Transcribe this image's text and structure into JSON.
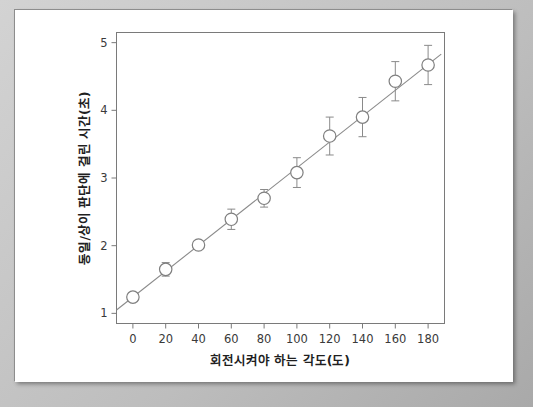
{
  "chart_data": {
    "type": "scatter",
    "title": "",
    "xlabel": "회전시켜야 하는 각도(도)",
    "ylabel": "동일/상이 판단에 걸린 시간(초)",
    "xlim": [
      -10,
      190
    ],
    "ylim": [
      0.85,
      5.15
    ],
    "xticks": [
      0,
      20,
      40,
      60,
      80,
      100,
      120,
      140,
      160,
      180
    ],
    "yticks": [
      1,
      2,
      3,
      4,
      5
    ],
    "xtick_labels": [
      "0",
      "20",
      "40",
      "60",
      "80",
      "100",
      "120",
      "140",
      "160",
      "180"
    ],
    "ytick_labels": [
      "1",
      "2",
      "3",
      "4",
      "5"
    ],
    "grid": false,
    "legend": "none",
    "marker_style": "open-circle",
    "x": [
      0,
      20,
      40,
      60,
      80,
      100,
      120,
      140,
      160,
      180
    ],
    "values": [
      1.24,
      1.65,
      2.01,
      2.39,
      2.7,
      3.08,
      3.62,
      3.9,
      4.43,
      4.67
    ],
    "errors": [
      0.0,
      0.1,
      0.0,
      0.15,
      0.13,
      0.22,
      0.28,
      0.29,
      0.29,
      0.29
    ],
    "fit_line": {
      "x": [
        -10,
        188
      ],
      "y": [
        1.05,
        4.83
      ],
      "slope": 0.0191,
      "intercept": 1.24
    },
    "series": [
      {
        "name": "동일/상이 판단에 걸린 시간(초)",
        "points": [
          {
            "x": 0,
            "y": 1.24,
            "err": 0.0
          },
          {
            "x": 20,
            "y": 1.65,
            "err": 0.1
          },
          {
            "x": 40,
            "y": 2.01,
            "err": 0.0
          },
          {
            "x": 60,
            "y": 2.39,
            "err": 0.15
          },
          {
            "x": 80,
            "y": 2.7,
            "err": 0.13
          },
          {
            "x": 100,
            "y": 3.08,
            "err": 0.22
          },
          {
            "x": 120,
            "y": 3.62,
            "err": 0.28
          },
          {
            "x": 140,
            "y": 3.9,
            "err": 0.29
          },
          {
            "x": 160,
            "y": 4.43,
            "err": 0.29
          },
          {
            "x": 180,
            "y": 4.67,
            "err": 0.29
          }
        ]
      }
    ]
  },
  "axes": {
    "x_title": "회전시켜야 하는 각도(도)",
    "y_title": "동일/상이 판단에 걸린 시간(초)"
  },
  "colors": {
    "page_background": "#ffffff",
    "outer_background": "#c9c9c9",
    "frame": "#7a7a7a",
    "line": "#8a8a8a",
    "marker_fill": "#ffffff",
    "marker_stroke": "#7f7f7f",
    "text": "#3a3a3a"
  }
}
